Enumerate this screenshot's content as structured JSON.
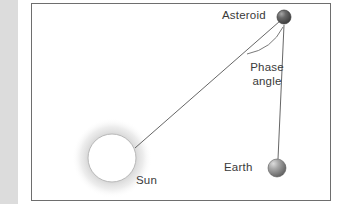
{
  "figure": {
    "kind": "astronomy-geometry-diagram",
    "border_color": "#6e6e6e",
    "background_color": "#ffffff",
    "margin_bar_color": "#dcdcdc",
    "line_color": "#555555",
    "text_color": "#3a3a3a"
  },
  "labels": {
    "asteroid": "Asteroid",
    "earth": "Earth",
    "sun": "Sun",
    "phase_angle_line1": "Phase",
    "phase_angle_line2": "angle"
  },
  "bodies": {
    "sun": {
      "name": "Sun",
      "cx": 81,
      "cy": 155,
      "r": 24,
      "fill": "#ffffff",
      "stroke": "#b4b4b4",
      "glow": "#d6d6d6"
    },
    "asteroid": {
      "name": "Asteroid",
      "cx": 253,
      "cy": 14,
      "r": 7,
      "fill": "#4a4a4a",
      "highlight": "#9a9a9a"
    },
    "earth": {
      "name": "Earth",
      "cx": 246,
      "cy": 165,
      "r": 9,
      "fill": "#6e6e6e",
      "highlight": "#cfcfcf"
    }
  },
  "connectors": {
    "sun_to_asteroid": {
      "x1": 104,
      "y1": 145,
      "x2": 250,
      "y2": 18
    },
    "asteroid_to_earth": {
      "x1": 253,
      "y1": 22,
      "x2": 246,
      "y2": 155
    },
    "phase_angle_arc": {
      "start_x": 216,
      "start_y": 50,
      "end_x": 252,
      "end_y": 50,
      "bow_y": 28
    }
  }
}
